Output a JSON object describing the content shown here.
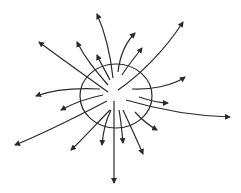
{
  "diagram": {
    "stroke_color": "#2a2a2a",
    "background": "#ffffff",
    "ellipse": {
      "cx": 116,
      "cy": 96,
      "rx": 36,
      "ry": 32
    },
    "field_lines": [
      {
        "d": "M113,78 C110,50 104,30 97,14",
        "tip": [
          97,
          14
        ]
      },
      {
        "d": "M108,92 C85,75 60,58 39,42",
        "tip": [
          39,
          42
        ]
      },
      {
        "d": "M108,85 C95,70 85,58 77,42",
        "tip": [
          77,
          42
        ]
      },
      {
        "d": "M110,80 C105,70 100,62 97,55",
        "tip": [
          97,
          55
        ]
      },
      {
        "d": "M118,72 C120,55 126,42 135,33",
        "tip": [
          135,
          33
        ]
      },
      {
        "d": "M122,75 C128,65 136,56 142,48",
        "tip": [
          142,
          48
        ]
      },
      {
        "d": "M118,90 C140,75 165,50 183,22",
        "tip": [
          183,
          22
        ]
      },
      {
        "d": "M132,89 C150,90 172,86 185,77",
        "tip": [
          185,
          77
        ]
      },
      {
        "d": "M139,97 C148,100 158,103 168,103",
        "tip": [
          168,
          103
        ]
      },
      {
        "d": "M126,100 C160,110 195,116 230,117",
        "tip": [
          230,
          117
        ]
      },
      {
        "d": "M135,112 C142,120 150,126 157,130",
        "tip": [
          157,
          130
        ]
      },
      {
        "d": "M100,89 C80,88 55,89 36,96",
        "tip": [
          36,
          96
        ]
      },
      {
        "d": "M103,95 C88,98 72,104 61,110",
        "tip": [
          61,
          110
        ]
      },
      {
        "d": "M107,101 C80,115 45,133 15,145",
        "tip": [
          15,
          145
        ]
      },
      {
        "d": "M110,110 C98,122 84,138 71,150",
        "tip": [
          71,
          150
        ]
      },
      {
        "d": "M111,110 C106,120 103,132 102,145",
        "tip": [
          102,
          145
        ]
      },
      {
        "d": "M114,101 C114,130 114,160 114,183",
        "tip": [
          114,
          183
        ]
      },
      {
        "d": "M119,110 C121,120 122,132 123,143",
        "tip": [
          123,
          143
        ]
      },
      {
        "d": "M123,110 C130,125 137,140 143,154",
        "tip": [
          143,
          154
        ]
      }
    ]
  }
}
